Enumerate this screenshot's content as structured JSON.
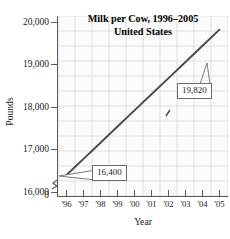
{
  "chart_data": {
    "type": "line",
    "title": "Milk per Cow, 1996–2005",
    "subtitle": "United States",
    "xlabel": "Year",
    "ylabel": "Pounds",
    "categories": [
      "'96",
      "'97",
      "'98",
      "'99",
      "'00",
      "'01",
      "'02",
      "'03",
      "'04",
      "'05"
    ],
    "x": [
      1996,
      1997,
      1998,
      1999,
      2000,
      2001,
      2002,
      2003,
      2004,
      2005
    ],
    "values": [
      16400,
      16780,
      17160,
      17540,
      17920,
      18300,
      18680,
      19060,
      19440,
      19820
    ],
    "ylim": [
      16000,
      20000
    ],
    "ytick_values": [
      16000,
      17000,
      18000,
      19000,
      20000
    ],
    "ytick_labels": [
      "16,000",
      "17,000",
      "18,000",
      "19,000",
      "20,000"
    ],
    "zero_label": "0",
    "axis_break": true,
    "grid": true,
    "legend": "none",
    "series_color": "#4a4a4a",
    "grid_color": "#d9d9d9",
    "annotations": [
      {
        "label": "16,400",
        "value": 16400,
        "at_category": "'96"
      },
      {
        "label": "19,820",
        "value": 19820,
        "at_category": "'05"
      }
    ]
  },
  "figure": {
    "background": "#ffffff",
    "plot_background": "#fbfbfb",
    "axis_color": "#5b5b5b"
  }
}
